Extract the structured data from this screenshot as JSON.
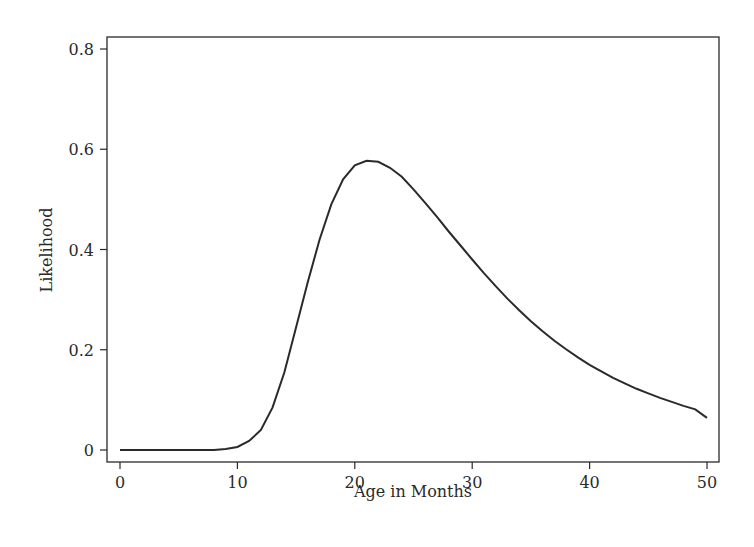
{
  "chart_data": {
    "type": "line",
    "title": "",
    "xlabel": "Age in Months",
    "ylabel": "Likelihood",
    "xlim": [
      0,
      50
    ],
    "ylim": [
      0,
      0.8
    ],
    "xticks": [
      0,
      10,
      20,
      30,
      40,
      50
    ],
    "xtick_labels": [
      "0",
      "10",
      "20",
      "30",
      "40",
      "50"
    ],
    "yticks": [
      0,
      0.2,
      0.4,
      0.6,
      0.8
    ],
    "ytick_labels": [
      "0",
      "0.2",
      "0.4",
      "0.6",
      "0.8"
    ],
    "grid": false,
    "legend": null,
    "series": [
      {
        "name": "Likelihood",
        "color": "#2a2a2a",
        "x": [
          0,
          1,
          2,
          3,
          4,
          5,
          6,
          7,
          8,
          9,
          10,
          11,
          12,
          13,
          14,
          15,
          16,
          17,
          18,
          19,
          20,
          21,
          22,
          23,
          24,
          25,
          26,
          27,
          28,
          29,
          30,
          31,
          32,
          33,
          34,
          35,
          36,
          37,
          38,
          39,
          40,
          41,
          42,
          43,
          44,
          45,
          46,
          47,
          48,
          49,
          50
        ],
        "y": [
          0.0,
          0.0,
          0.0,
          0.0,
          0.0,
          0.0,
          0.0,
          0.0,
          0.0,
          0.002,
          0.006,
          0.018,
          0.04,
          0.085,
          0.155,
          0.245,
          0.335,
          0.42,
          0.49,
          0.54,
          0.568,
          0.577,
          0.575,
          0.563,
          0.545,
          0.52,
          0.493,
          0.465,
          0.436,
          0.408,
          0.38,
          0.353,
          0.327,
          0.302,
          0.279,
          0.257,
          0.237,
          0.218,
          0.201,
          0.185,
          0.17,
          0.157,
          0.144,
          0.133,
          0.122,
          0.113,
          0.104,
          0.096,
          0.088,
          0.081,
          0.064
        ]
      }
    ]
  }
}
